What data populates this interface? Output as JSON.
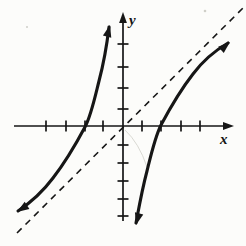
{
  "figure": {
    "kind": "math-function-graph",
    "background": "#fcfcfa"
  },
  "chart_data": {
    "type": "line",
    "title": "",
    "xlabel": "x",
    "ylabel": "y",
    "xlim": [
      -5.7,
      5.8
    ],
    "ylim": [
      -5.8,
      5.9
    ],
    "x_tick_positions": [
      -4,
      -3,
      -2,
      -1,
      1,
      2,
      3,
      4
    ],
    "y_tick_positions": [
      -5,
      -4,
      -3,
      -2,
      -1,
      1,
      2,
      3,
      4
    ],
    "tick_labels_shown": false,
    "grid": false,
    "legend": false,
    "implied_function": "y = x - 4/x",
    "x_intercepts": [
      -2,
      2
    ],
    "asymptotes": {
      "slant": {
        "equation": "y = x",
        "style": "dashed"
      },
      "vertical": {
        "equation": "x = 0 (y-axis)"
      }
    },
    "curve_end_arrows": true,
    "series": [
      {
        "name": "left branch (x < 0)",
        "points": [
          [
            -5.5,
            -4.77
          ],
          [
            -5,
            -4.2
          ],
          [
            -4,
            -3
          ],
          [
            -3,
            -1.67
          ],
          [
            -2.5,
            -0.9
          ],
          [
            -2,
            0
          ],
          [
            -1.5,
            1.17
          ],
          [
            -1,
            3
          ],
          [
            -0.8,
            4.2
          ],
          [
            -0.7,
            5.01
          ]
        ]
      },
      {
        "name": "right branch (x > 0)",
        "points": [
          [
            0.7,
            -5.01
          ],
          [
            0.8,
            -4.2
          ],
          [
            1,
            -3
          ],
          [
            1.5,
            -1.17
          ],
          [
            2,
            0
          ],
          [
            2.5,
            0.9
          ],
          [
            3,
            1.67
          ],
          [
            4,
            3
          ],
          [
            5,
            4.2
          ],
          [
            5.5,
            4.77
          ]
        ]
      }
    ]
  },
  "render": {
    "colors": {
      "ink": "#161616",
      "background": "#fcfcfa",
      "artifact": "#d9d9d3",
      "speckle": "#cfcfc8"
    },
    "axes": {
      "stroke_width": 1.7,
      "tick_half": 5.5,
      "x": {
        "x1": 14,
        "y1": 126,
        "x2": 226,
        "y2": 126,
        "arrow": {
          "tip": [
            234,
            126
          ],
          "angle": 0
        }
      },
      "y": {
        "x1": 123,
        "y1": 20,
        "x2": 123,
        "y2": 221,
        "arrow": {
          "tip": [
            123,
            12
          ],
          "angle": -90
        }
      },
      "x_ticks": [
        46,
        66,
        85,
        103,
        142,
        161,
        181,
        200
      ],
      "y_ticks": [
        44,
        67,
        88,
        109,
        145,
        163,
        181,
        199,
        216
      ],
      "axis_arrow_len": 11,
      "axis_arrow_halfwidth": 3.9
    },
    "asymptote": {
      "x1": 17,
      "y1": 233,
      "x2": 243,
      "y2": 8,
      "dash": "6.5,5.5",
      "stroke_width": 1.6
    },
    "curves": {
      "stroke_width": 3.1,
      "left_path": "M18,211 C30,203 41,194 53,178 C67,160 77,142 85,127 C91,116 95,97 99,81 C104,62 107,44 109,27",
      "right_path": "M136,223 C139,207 142,190 147,171 C151,155 155,137 161,125 C169,110 179,92 193,74 C205,58 216,50 228,43",
      "arrow_len": 12,
      "arrow_halfwidth": 4.3,
      "arrows": [
        {
          "tip": [
            17,
            212
          ],
          "angle": 147,
          "name": "left-branch-lower-arrowhead"
        },
        {
          "tip": [
            110,
            25
          ],
          "angle": -76,
          "name": "left-branch-upper-arrowhead"
        },
        {
          "tip": [
            136,
            225
          ],
          "angle": 105,
          "name": "right-branch-lower-arrowhead"
        },
        {
          "tip": [
            230,
            42
          ],
          "angle": -41,
          "name": "right-branch-upper-arrowhead"
        }
      ]
    },
    "artifact_path": "M125,130 Q139,143 147,167",
    "speckles": [
      {
        "x": 205,
        "y": 11,
        "r": 1.3
      },
      {
        "x": 27,
        "y": 27,
        "r": 1.0
      }
    ],
    "labels": {
      "x": {
        "x": 220,
        "y": 144
      },
      "y": {
        "x": 129,
        "y": 25
      }
    }
  }
}
